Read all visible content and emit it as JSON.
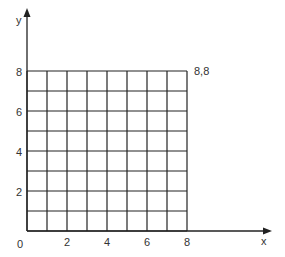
{
  "axes": {
    "x_label": "x",
    "y_label": "y"
  },
  "grid": {
    "cols": 8,
    "rows": 8,
    "origin_px": [
      27,
      231
    ],
    "unit_px": 20
  },
  "x_ticks": [
    "0",
    "2",
    "4",
    "6",
    "8"
  ],
  "y_ticks": [
    "2",
    "4",
    "6",
    "8"
  ],
  "corner_label": "8,8",
  "colors": {
    "line": "#222222",
    "text": "#333333"
  }
}
